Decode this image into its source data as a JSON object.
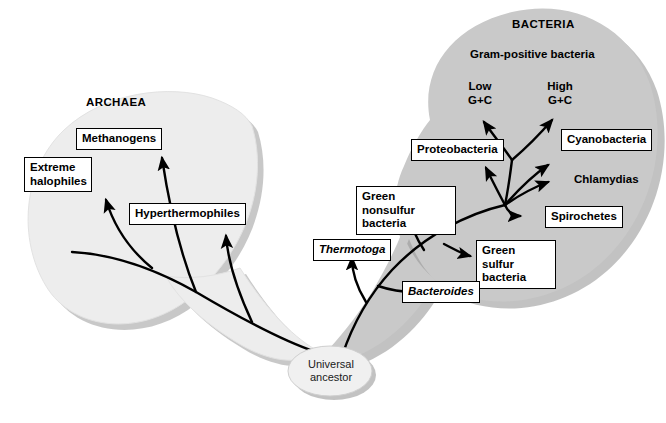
{
  "figure": {
    "type": "phylogenetic-tree",
    "colors": {
      "archaea_blob": "#ededed",
      "bacteria_blob": "#c9c9c9",
      "blob_shadow": "#9a9a9a",
      "root_ellipse": "#f0f0f0",
      "branch": "#000000",
      "box_fill": "#ffffff",
      "box_border": "#000000",
      "background": "#ffffff"
    }
  },
  "domains": {
    "archaea": {
      "title": "ARCHAEA",
      "taxa": [
        {
          "label": "Extreme\nhalophiles",
          "boxed": true,
          "italic": false
        },
        {
          "label": "Methanogens",
          "boxed": true,
          "italic": false
        },
        {
          "label": "Hyperthermophiles",
          "boxed": true,
          "italic": false
        }
      ]
    },
    "bacteria": {
      "title": "BACTERIA",
      "group_heading": "Gram-positive bacteria",
      "group_members": [
        {
          "label": "Low\nG+C",
          "boxed": false,
          "italic": false
        },
        {
          "label": "High\nG+C",
          "boxed": false,
          "italic": false
        }
      ],
      "taxa": [
        {
          "label": "Proteobacteria",
          "boxed": true,
          "italic": false
        },
        {
          "label": "Cyanobacteria",
          "boxed": true,
          "italic": false
        },
        {
          "label": "Chlamydias",
          "boxed": false,
          "italic": false
        },
        {
          "label": "Spirochetes",
          "boxed": true,
          "italic": false
        },
        {
          "label": "Green sulfur\nbacteria",
          "boxed": true,
          "italic": false
        },
        {
          "label": "Green nonsulfur\nbacteria",
          "boxed": true,
          "italic": false
        },
        {
          "label": "Bacteroides",
          "boxed": true,
          "italic": true
        },
        {
          "label": "Thermotoga",
          "boxed": true,
          "italic": true
        }
      ]
    }
  },
  "root": {
    "label": "Universal\nancestor"
  }
}
